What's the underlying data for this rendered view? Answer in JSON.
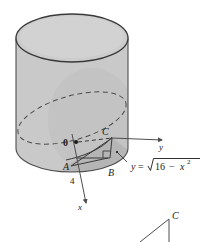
{
  "figure": {
    "kind": "solid-geometry-diagram",
    "title_text": "",
    "colors": {
      "cylinder_fill": "#c9c9c9",
      "cylinder_top_fill": "#cfcfcf",
      "cylinder_shadow_fill": "#b3b3b3",
      "outline": "#4d4d4d",
      "dark_outline": "#3a3a3a",
      "label_color": "#1a1a1a",
      "background": "#ffffff"
    },
    "labels": {
      "origin": "0",
      "point_a": "A",
      "point_b": "B",
      "point_c": "C",
      "axis_y": "y",
      "axis_x": "x",
      "radius_value": "4"
    },
    "equation": {
      "lhs": "y",
      "equals": "=",
      "radicand_first": "16",
      "minus": "−",
      "radicand_var": "x",
      "radicand_exponent": "2"
    },
    "inset": {
      "label_c": "C"
    }
  }
}
